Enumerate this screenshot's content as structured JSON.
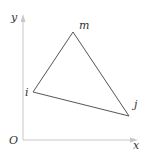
{
  "diagram": {
    "type": "coordinate-triangle",
    "axes": {
      "x_label": "x",
      "y_label": "y",
      "origin_label": "O",
      "axis_color": "#c8c8c8"
    },
    "triangle": {
      "stroke_color": "#555555",
      "vertices": [
        {
          "label": "i",
          "x": 33,
          "y": 92
        },
        {
          "label": "j",
          "x": 129,
          "y": 116
        },
        {
          "label": "m",
          "x": 73,
          "y": 32
        }
      ]
    }
  }
}
